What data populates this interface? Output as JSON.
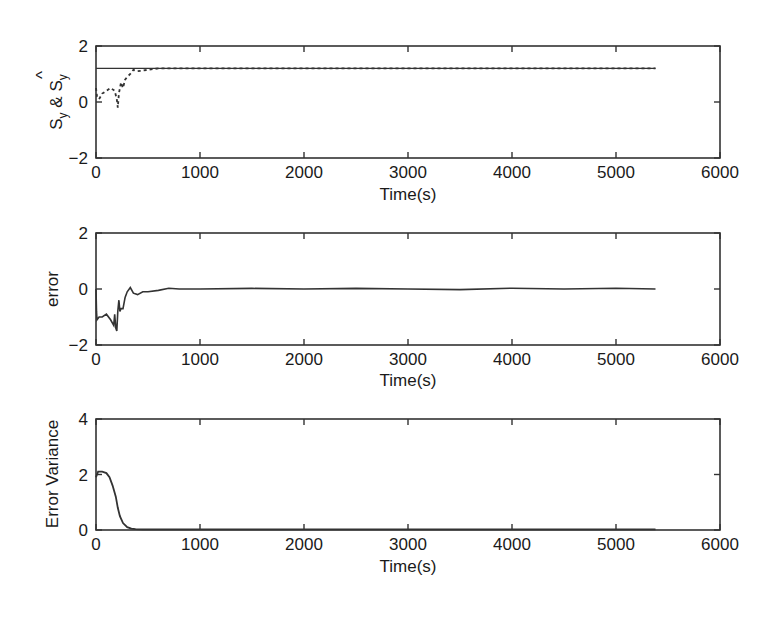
{
  "chart_data": [
    {
      "type": "line",
      "panel": "top",
      "title": "",
      "xlabel": "Time(s)",
      "ylabel": "S_y & Ŝ_y",
      "ylabel_parts": {
        "s1": "S",
        "sub1": "y",
        "amp": " & ",
        "s2": "S",
        "hat": "^",
        "sub2": "y"
      },
      "xlim": [
        0,
        6000
      ],
      "ylim": [
        -2,
        2
      ],
      "xticks": [
        "0",
        "1000",
        "2000",
        "3000",
        "4000",
        "5000",
        "6000"
      ],
      "yticks": [
        "-2",
        "0",
        "2"
      ],
      "grid": false,
      "series": [
        {
          "name": "S_y (reference)",
          "style": "solid",
          "x": [
            0,
            5380
          ],
          "y": [
            1.2,
            1.2
          ]
        },
        {
          "name": "Ŝ_y (estimate)",
          "style": "dashed",
          "x": [
            0,
            10,
            30,
            60,
            100,
            140,
            180,
            200,
            210,
            220,
            240,
            260,
            280,
            300,
            330,
            360,
            400,
            450,
            500,
            550,
            600,
            700,
            800,
            1000,
            1500,
            2000,
            2500,
            3000,
            3500,
            4000,
            4500,
            5000,
            5380
          ],
          "y": [
            0.5,
            0.2,
            0.1,
            0.3,
            0.4,
            0.5,
            0.4,
            0.1,
            -0.2,
            0.3,
            0.7,
            0.5,
            0.8,
            0.9,
            1.0,
            1.15,
            1.1,
            1.12,
            1.15,
            1.18,
            1.2,
            1.2,
            1.2,
            1.2,
            1.2,
            1.2,
            1.2,
            1.2,
            1.2,
            1.2,
            1.2,
            1.2,
            1.2
          ]
        }
      ]
    },
    {
      "type": "line",
      "panel": "middle",
      "title": "",
      "xlabel": "Time(s)",
      "ylabel": "error",
      "xlim": [
        0,
        6000
      ],
      "ylim": [
        -2,
        2
      ],
      "xticks": [
        "0",
        "1000",
        "2000",
        "3000",
        "4000",
        "5000",
        "6000"
      ],
      "yticks": [
        "-2",
        "0",
        "2"
      ],
      "grid": false,
      "series": [
        {
          "name": "error",
          "style": "solid",
          "x": [
            0,
            5,
            10,
            30,
            60,
            100,
            140,
            170,
            180,
            190,
            200,
            210,
            220,
            230,
            240,
            260,
            280,
            300,
            330,
            360,
            400,
            450,
            500,
            600,
            700,
            800,
            1000,
            1500,
            2000,
            2500,
            3000,
            3500,
            4000,
            4500,
            5000,
            5380
          ],
          "y": [
            0.0,
            -0.8,
            -1.1,
            -1.0,
            -1.0,
            -0.9,
            -1.1,
            -1.3,
            -0.9,
            -1.4,
            -1.5,
            -0.8,
            -0.4,
            -0.8,
            -0.7,
            -0.7,
            -0.3,
            -0.1,
            0.05,
            -0.15,
            -0.2,
            -0.1,
            -0.1,
            -0.05,
            0.03,
            0.0,
            0.0,
            0.02,
            0.0,
            0.02,
            0.0,
            -0.02,
            0.03,
            0.0,
            0.03,
            0.0
          ]
        }
      ]
    },
    {
      "type": "line",
      "panel": "bottom",
      "title": "",
      "xlabel": "Time(s)",
      "ylabel": "Error Variance",
      "xlim": [
        0,
        6000
      ],
      "ylim": [
        0,
        4
      ],
      "xticks": [
        "0",
        "1000",
        "2000",
        "3000",
        "4000",
        "5000",
        "6000"
      ],
      "yticks": [
        "0",
        "2",
        "4"
      ],
      "grid": false,
      "series": [
        {
          "name": "error variance",
          "style": "solid",
          "x": [
            0,
            20,
            60,
            100,
            130,
            160,
            190,
            210,
            230,
            260,
            300,
            340,
            380,
            450,
            1000,
            2000,
            3000,
            4000,
            5000,
            5380
          ],
          "y": [
            1.9,
            2.1,
            2.1,
            2.05,
            1.9,
            1.6,
            1.2,
            0.8,
            0.5,
            0.25,
            0.1,
            0.05,
            0.03,
            0.02,
            0.02,
            0.02,
            0.02,
            0.02,
            0.02,
            0.02
          ]
        }
      ]
    }
  ],
  "labels": {
    "xlabel": "Time(s)",
    "top_y_s": "S",
    "top_y_sub": "y",
    "top_y_amp": "&",
    "top_y_hat": "^",
    "middle_y": "error",
    "bottom_y": "Error Variance",
    "xticks": [
      "0",
      "1000",
      "2000",
      "3000",
      "4000",
      "5000",
      "6000"
    ],
    "top_yticks": [
      "2",
      "0",
      "−2"
    ],
    "middle_yticks": [
      "2",
      "0",
      "−2"
    ],
    "bottom_yticks": [
      "4",
      "2",
      "0"
    ]
  }
}
